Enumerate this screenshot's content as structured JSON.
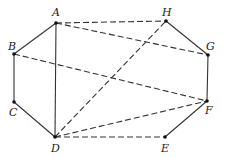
{
  "diagram": {
    "points": [
      {
        "id": "A",
        "x": 56,
        "y": 23,
        "lx": 52,
        "ly": 16
      },
      {
        "id": "B",
        "x": 14,
        "y": 54,
        "lx": 8,
        "ly": 50
      },
      {
        "id": "C",
        "x": 14,
        "y": 102,
        "lx": 9,
        "ly": 116
      },
      {
        "id": "D",
        "x": 55,
        "y": 137,
        "lx": 51,
        "ly": 152
      },
      {
        "id": "E",
        "x": 165,
        "y": 137,
        "lx": 161,
        "ly": 152
      },
      {
        "id": "F",
        "x": 207,
        "y": 101,
        "lx": 205,
        "ly": 114
      },
      {
        "id": "G",
        "x": 208,
        "y": 55,
        "lx": 206,
        "ly": 50
      },
      {
        "id": "H",
        "x": 166,
        "y": 21,
        "lx": 162,
        "ly": 16
      }
    ],
    "solid_edges": [
      [
        "A",
        "B"
      ],
      [
        "B",
        "C"
      ],
      [
        "C",
        "D"
      ],
      [
        "A",
        "D"
      ],
      [
        "E",
        "F"
      ],
      [
        "F",
        "G"
      ],
      [
        "G",
        "H"
      ]
    ],
    "dashed_edges": [
      [
        "A",
        "H"
      ],
      [
        "A",
        "G"
      ],
      [
        "B",
        "F"
      ],
      [
        "D",
        "H"
      ],
      [
        "D",
        "F"
      ],
      [
        "D",
        "E"
      ]
    ],
    "colors": {
      "line": "#333333",
      "point": "#111111"
    }
  }
}
